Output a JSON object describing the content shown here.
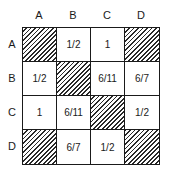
{
  "matrix": {
    "column_labels": [
      "A",
      "B",
      "C",
      "D"
    ],
    "row_labels": [
      "A",
      "B",
      "C",
      "D"
    ],
    "cells": [
      [
        {
          "value": "",
          "hatched": true
        },
        {
          "value": "1/2",
          "hatched": false
        },
        {
          "value": "1",
          "hatched": false
        },
        {
          "value": "",
          "hatched": true
        }
      ],
      [
        {
          "value": "1/2",
          "hatched": false
        },
        {
          "value": "",
          "hatched": true
        },
        {
          "value": "6/11",
          "hatched": false
        },
        {
          "value": "6/7",
          "hatched": false
        }
      ],
      [
        {
          "value": "1",
          "hatched": false
        },
        {
          "value": "6/11",
          "hatched": false
        },
        {
          "value": "",
          "hatched": true
        },
        {
          "value": "1/2",
          "hatched": false
        }
      ],
      [
        {
          "value": "",
          "hatched": true
        },
        {
          "value": "6/7",
          "hatched": false
        },
        {
          "value": "1/2",
          "hatched": false
        },
        {
          "value": "",
          "hatched": true
        }
      ]
    ]
  }
}
